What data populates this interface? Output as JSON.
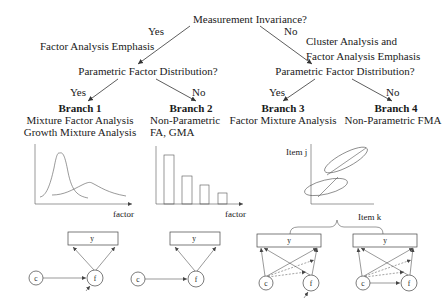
{
  "root": {
    "question": "Measurement Invariance?",
    "yes_label": "Yes",
    "no_label": "No",
    "yes_emphasis": "Factor Analysis Emphasis",
    "no_emphasis_line1": "Cluster Analysis and",
    "no_emphasis_line2": "Factor Analysis Emphasis"
  },
  "left_question": {
    "question": "Parametric Factor Distribution?",
    "yes_label": "Yes",
    "no_label": "No"
  },
  "right_question": {
    "question": "Parametric Factor Distribution?",
    "yes_label": "Yes",
    "no_label": "No"
  },
  "branches": [
    {
      "title": "Branch 1",
      "line1": "Mixture Factor Analysis",
      "line2": "Growth Mixture Analysis"
    },
    {
      "title": "Branch 2",
      "line1": "Non-Parametric",
      "line2": "FA, GMA"
    },
    {
      "title": "Branch 3",
      "line1": "Factor Mixture Analysis",
      "line2": ""
    },
    {
      "title": "Branch 4",
      "line1": "Non-Parametric FMA",
      "line2": ""
    }
  ],
  "plots": {
    "density": {
      "xlabel": "factor",
      "curves": [
        "narrow-tall",
        "wide-low"
      ]
    },
    "bars": {
      "xlabel": "factor",
      "heights": [
        100,
        54,
        37,
        21
      ]
    },
    "scatter": {
      "xlabel": "Item k",
      "ylabel": "Item j"
    }
  },
  "path_diagrams": {
    "observed_label": "y",
    "covariate_label": "c",
    "factor_label": "f"
  },
  "colors": {
    "ink": "#1a1a1a",
    "line": "#333333",
    "background": "#ffffff"
  }
}
